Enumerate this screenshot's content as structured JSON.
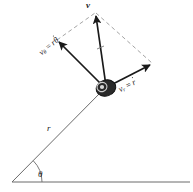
{
  "figure": {
    "background_color": "#ffffff",
    "stroke_color": "#1a1a1a",
    "dashed_color": "#9a9a9a",
    "axis_color": "#6b6b6b",
    "width": 193,
    "height": 192
  },
  "labels": {
    "resultant_velocity": "v",
    "transverse_velocity_symbol": "v",
    "transverse_velocity_subscript": "θ",
    "transverse_velocity_equals": "=",
    "transverse_velocity_value_r": "r",
    "transverse_velocity_value_thetadot": "θ",
    "radial_velocity_symbol": "v",
    "radial_velocity_subscript": "r",
    "radial_velocity_equals": "=",
    "radial_velocity_value_rdot": "r",
    "radius": "r",
    "angle": "θ",
    "transverse_velocity_full": "vθ = rθ̇",
    "radial_velocity_full": "vr = ṙ"
  },
  "geometry": {
    "origin": {
      "x": 12,
      "y": 182
    },
    "particle": {
      "x": 105,
      "y": 88
    },
    "tip_v": {
      "x": 95,
      "y": 12
    },
    "tip_v_theta": {
      "x": 57,
      "y": 40
    },
    "tip_v_r": {
      "x": 152,
      "y": 63
    },
    "dashed_corner_left": {
      "x": 57,
      "y": 40
    },
    "dashed_corner_right": {
      "x": 152,
      "y": 63
    },
    "baseline_start": {
      "x": 12,
      "y": 182
    },
    "baseline_end": {
      "x": 190,
      "y": 182
    },
    "angle_arc_radius": 30,
    "angle_degrees": 45
  }
}
